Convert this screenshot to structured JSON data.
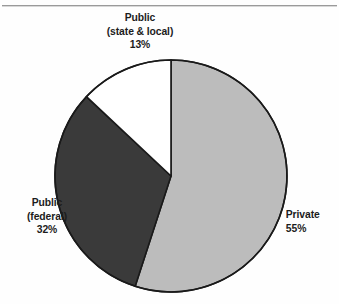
{
  "figure": {
    "background_color": "#fefefe",
    "rule_color": "#9a9a9a",
    "has_top_rule": true,
    "has_bottom_rule": false
  },
  "chart_data": {
    "type": "pie",
    "title": "",
    "subtitle": "",
    "xlabel": "",
    "ylabel": "",
    "legend_position": "none",
    "grid": false,
    "start_angle_deg": 0,
    "direction": "clockwise",
    "center": {
      "x": 171,
      "y": 176
    },
    "radius": 116,
    "outline_color": "#1a1a1a",
    "categories": [
      "Private",
      "Public (federal)",
      "Public (state & local)"
    ],
    "values": [
      55,
      32,
      13
    ],
    "value_unit": "%",
    "colors": [
      "#bcbcbc",
      "#3a3a3a",
      "#ffffff"
    ],
    "slices": [
      {
        "name": "Private",
        "label_line_1": "Private",
        "label_line_2": "55%",
        "value": 55,
        "value_text": "55%",
        "color": "#bcbcbc",
        "start_deg": 0,
        "end_deg": 198
      },
      {
        "name": "Public (federal)",
        "label_line_1": "Public",
        "label_line_2": "(federal)",
        "label_line_3": "32%",
        "value": 32,
        "value_text": "32%",
        "color": "#3a3a3a",
        "start_deg": 198,
        "end_deg": 313.2
      },
      {
        "name": "Public (state & local)",
        "label_line_1": "Public",
        "label_line_2": "(state & local)",
        "label_line_3": "13%",
        "value": 13,
        "value_text": "13%",
        "color": "#ffffff",
        "start_deg": 313.2,
        "end_deg": 360
      }
    ]
  },
  "labels": {
    "state_local": {
      "line1": "Public",
      "line2": "(state & local)",
      "line3": "13%"
    },
    "federal": {
      "line1": "Public",
      "line2": "(federal)",
      "line3": "32%"
    },
    "private": {
      "line1": "Private",
      "line2": "55%"
    }
  }
}
